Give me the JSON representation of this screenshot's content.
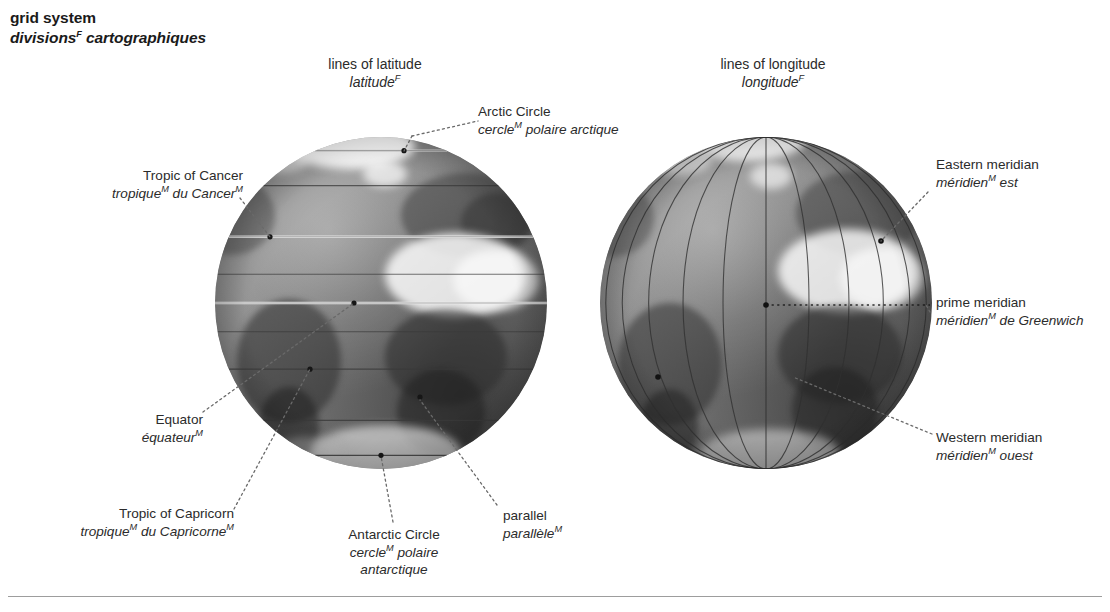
{
  "title": {
    "en": "grid system",
    "fr": "divisions",
    "fr_gender": "F",
    "fr_rest": "cartographiques"
  },
  "headings": [
    {
      "id": "lines-of-latitude",
      "en": "lines of latitude",
      "fr": "latitude",
      "fr_gender": "F"
    },
    {
      "id": "lines-of-longitude",
      "en": "lines of longitude",
      "fr": "longitude",
      "fr_gender": "F"
    }
  ],
  "callouts": {
    "arctic_circle": {
      "en": "Arctic Circle",
      "fr_a": "cercle",
      "fr_gender": "M",
      "fr_b": " polaire arctique"
    },
    "tropic_of_cancer": {
      "en": "Tropic of Cancer",
      "fr_a": "tropique",
      "fr_gender": "M",
      "fr_b": " du Cancer",
      "fr_gender2": "M"
    },
    "equator": {
      "en": "Equator",
      "fr_a": "équateur",
      "fr_gender": "M"
    },
    "tropic_of_capricorn": {
      "en": "Tropic of Capricorn",
      "fr_a": "tropique",
      "fr_gender": "M",
      "fr_b": " du Capricorne",
      "fr_gender2": "M"
    },
    "antarctic_circle": {
      "en": "Antarctic Circle",
      "fr_a": "cercle",
      "fr_gender": "M",
      "fr_b": " polaire",
      "fr_c": "antarctique"
    },
    "parallel": {
      "en": "parallel",
      "fr_a": "parallèle",
      "fr_gender": "M"
    },
    "eastern_meridian": {
      "en": "Eastern meridian",
      "fr_a": "méridien",
      "fr_gender": "M",
      "fr_b": " est"
    },
    "prime_meridian": {
      "en": "prime meridian",
      "fr_a": "méridien",
      "fr_gender": "M",
      "fr_b": " de Greenwich"
    },
    "western_meridian": {
      "en": "Western meridian",
      "fr_a": "méridien",
      "fr_gender": "M",
      "fr_b": " ouest"
    }
  },
  "colors": {
    "text": "#2b2b2b",
    "title": "#1a1a1a",
    "leader_line": "#6a6a6a",
    "grid_line": "#3a3a3a",
    "highlight_line": "#e8e8e8",
    "rule": "#9d9d9d",
    "globe_base": "#8e8e8e"
  },
  "globes": {
    "latitude": {
      "label": "globe showing parallels of latitude",
      "center_x": 381,
      "center_y": 303,
      "radius": 166,
      "parallels": [
        66.5,
        45,
        23.5,
        10,
        0,
        -10,
        -23.5,
        -45,
        -66.5
      ]
    },
    "longitude": {
      "label": "globe showing meridians of longitude",
      "center_x": 766,
      "center_y": 303,
      "radius": 166,
      "meridians": [
        -75,
        -60,
        -45,
        -30,
        -15,
        0,
        15,
        30,
        45,
        60,
        75
      ]
    }
  }
}
